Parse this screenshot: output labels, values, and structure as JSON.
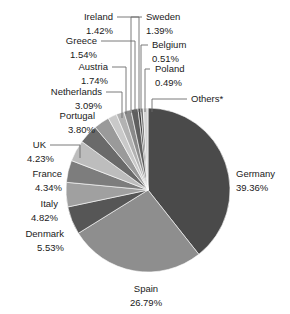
{
  "chart_data": {
    "type": "pie",
    "title": "",
    "subtitle": "",
    "xlabel": "",
    "ylabel": "",
    "legend_position": "none",
    "grid": false,
    "labels_show_percent": true,
    "start_angle_deg": 0,
    "direction": "clockwise",
    "categories": [
      "Germany",
      "Spain",
      "Denmark",
      "Italy",
      "France",
      "UK",
      "Portugal",
      "Netherlands",
      "Austria",
      "Greece",
      "Ireland",
      "Sweden",
      "Belgium",
      "Poland",
      "Others*"
    ],
    "values": [
      39.36,
      26.79,
      5.53,
      4.82,
      4.34,
      4.23,
      3.8,
      3.09,
      1.74,
      1.54,
      1.42,
      1.39,
      0.51,
      0.49,
      0.95
    ],
    "value_texts": [
      "39.36%",
      "26.79%",
      "5.53%",
      "4.82%",
      "4.34%",
      "4.23%",
      "3.80%",
      "3.09%",
      "1.74%",
      "1.54%",
      "1.42%",
      "1.39%",
      "0.51%",
      "0.49%",
      ""
    ],
    "colors": [
      "#4a4a4a",
      "#8e8e8e",
      "#565656",
      "#a0a0a0",
      "#7d7d7d",
      "#bdbdbd",
      "#6a6a6a",
      "#9a9a9a",
      "#c9c9c9",
      "#b2b2b2",
      "#8a8a8a",
      "#5f5f5f",
      "#3c3c3c",
      "#707070",
      "#d4d4d4"
    ],
    "slices": [
      {
        "name": "Germany",
        "value": 39.36,
        "value_text": "39.36%",
        "color": "#4a4a4a"
      },
      {
        "name": "Spain",
        "value": 26.79,
        "value_text": "26.79%",
        "color": "#8e8e8e"
      },
      {
        "name": "Denmark",
        "value": 5.53,
        "value_text": "5.53%",
        "color": "#565656"
      },
      {
        "name": "Italy",
        "value": 4.82,
        "value_text": "4.82%",
        "color": "#a0a0a0"
      },
      {
        "name": "France",
        "value": 4.34,
        "value_text": "4.34%",
        "color": "#7d7d7d"
      },
      {
        "name": "UK",
        "value": 4.23,
        "value_text": "4.23%",
        "color": "#bdbdbd"
      },
      {
        "name": "Portugal",
        "value": 3.8,
        "value_text": "3.80%",
        "color": "#6a6a6a"
      },
      {
        "name": "Netherlands",
        "value": 3.09,
        "value_text": "3.09%",
        "color": "#9a9a9a"
      },
      {
        "name": "Austria",
        "value": 1.74,
        "value_text": "1.74%",
        "color": "#c9c9c9"
      },
      {
        "name": "Greece",
        "value": 1.54,
        "value_text": "1.54%",
        "color": "#b2b2b2"
      },
      {
        "name": "Ireland",
        "value": 1.42,
        "value_text": "1.42%",
        "color": "#8a8a8a"
      },
      {
        "name": "Sweden",
        "value": 1.39,
        "value_text": "1.39%",
        "color": "#5f5f5f"
      },
      {
        "name": "Belgium",
        "value": 0.51,
        "value_text": "0.51%",
        "color": "#3c3c3c"
      },
      {
        "name": "Poland",
        "value": 0.49,
        "value_text": "0.49%",
        "color": "#707070"
      },
      {
        "name": "Others*",
        "value": 0.95,
        "value_text": "",
        "color": "#d4d4d4"
      }
    ]
  },
  "labels": {
    "germany_name": "Germany",
    "germany_pct": "39.36%",
    "spain_name": "Spain",
    "spain_pct": "26.79%",
    "denmark_name": "Denmark",
    "denmark_pct": "5.53%",
    "italy_name": "Italy",
    "italy_pct": "4.82%",
    "france_name": "France",
    "france_pct": "4.34%",
    "uk_name": "UK",
    "uk_pct": "4.23%",
    "portugal_name": "Portugal",
    "portugal_pct": "3.80%",
    "netherlands_name": "Netherlands",
    "netherlands_pct": "3.09%",
    "austria_name": "Austria",
    "austria_pct": "1.74%",
    "greece_name": "Greece",
    "greece_pct": "1.54%",
    "ireland_name": "Ireland",
    "ireland_pct": "1.42%",
    "sweden_name": "Sweden",
    "sweden_pct": "1.39%",
    "belgium_name": "Belgium",
    "belgium_pct": "0.51%",
    "poland_name": "Poland",
    "poland_pct": "0.49%",
    "others_name": "Others*"
  },
  "geometry": {
    "center_x": 148,
    "center_y": 190,
    "radius": 82
  }
}
